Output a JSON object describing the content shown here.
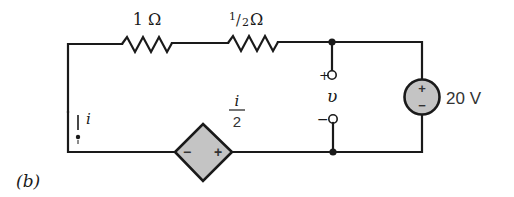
{
  "figure_label": "(b)",
  "components": {
    "resistor_1": {
      "label": "1 Ω",
      "value_ohms": 1
    },
    "resistor_2": {
      "label_num": "1",
      "label_slash": "/",
      "label_den": "2",
      "label_unit": " Ω",
      "value_ohms": 0.5
    },
    "voltage_source": {
      "label": "20 V",
      "plus": "+",
      "minus": "−",
      "value_volts": 20
    },
    "dependent_source": {
      "label_num": "i",
      "label_den": "2",
      "plus": "+",
      "minus": "−",
      "type": "controlled voltage source"
    },
    "output_terminals": {
      "plus": "+",
      "minus": "−",
      "label": "υ"
    },
    "current": {
      "label": "i",
      "direction": "down"
    }
  },
  "colors": {
    "wire": "#1a1a1a",
    "source_fill": "#c4c4c4",
    "background": "#ffffff"
  }
}
